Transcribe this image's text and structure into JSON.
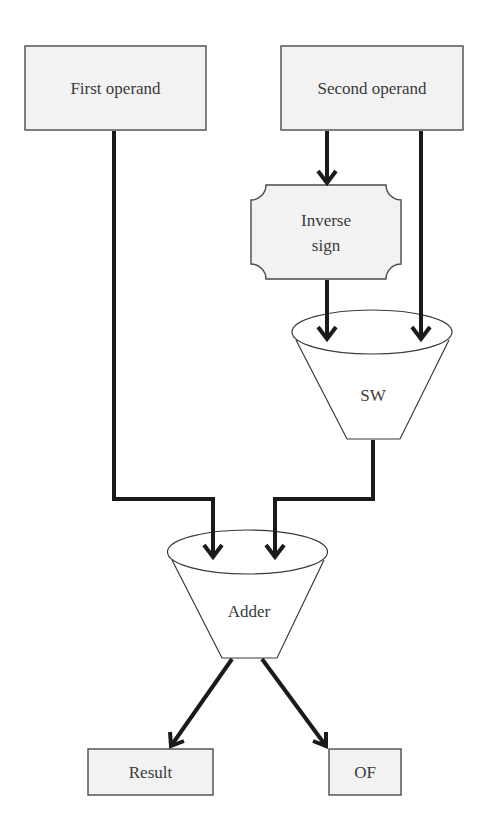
{
  "diagram": {
    "type": "flowchart",
    "colors": {
      "box_fill": "#f2f2f2",
      "box_stroke": "#4a4a4a",
      "edge": "#1a1a1a",
      "text": "#3a3a3a",
      "background": "#ffffff"
    },
    "nodes": {
      "first_operand": {
        "label": "First operand",
        "shape": "rectangle"
      },
      "second_operand": {
        "label": "Second operand",
        "shape": "rectangle"
      },
      "inverse_sign": {
        "label_line1": "Inverse",
        "label_line2": "sign",
        "shape": "notched-rectangle"
      },
      "sw": {
        "label": "SW",
        "shape": "funnel"
      },
      "adder": {
        "label": "Adder",
        "shape": "funnel"
      },
      "result": {
        "label": "Result",
        "shape": "rectangle"
      },
      "of": {
        "label": "OF",
        "shape": "rectangle"
      }
    },
    "edges": [
      {
        "from": "Second operand",
        "to": "Inverse sign"
      },
      {
        "from": "Inverse sign",
        "to": "SW"
      },
      {
        "from": "Second operand",
        "to": "SW"
      },
      {
        "from": "First operand",
        "to": "Adder"
      },
      {
        "from": "SW",
        "to": "Adder"
      },
      {
        "from": "Adder",
        "to": "Result"
      },
      {
        "from": "Adder",
        "to": "OF"
      }
    ]
  }
}
